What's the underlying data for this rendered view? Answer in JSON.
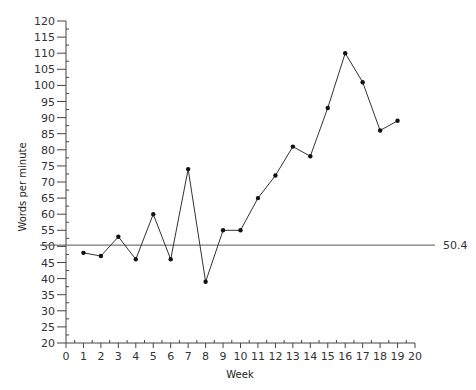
{
  "chart_data": {
    "type": "line",
    "title": "",
    "xlabel": "Week",
    "ylabel": "Words per minute",
    "xlim": [
      0,
      20
    ],
    "ylim": [
      20,
      120
    ],
    "x_ticks": [
      0,
      1,
      2,
      3,
      4,
      5,
      6,
      7,
      8,
      9,
      10,
      11,
      12,
      13,
      14,
      15,
      16,
      17,
      18,
      19,
      20
    ],
    "y_ticks": [
      20,
      25,
      30,
      35,
      40,
      45,
      50,
      55,
      60,
      65,
      70,
      75,
      80,
      85,
      90,
      95,
      100,
      105,
      110,
      115,
      120
    ],
    "grid": false,
    "legend": null,
    "x": [
      1,
      2,
      3,
      4,
      5,
      6,
      7,
      8,
      9,
      10,
      11,
      12,
      13,
      14,
      15,
      16,
      17,
      18,
      19
    ],
    "series": [
      {
        "name": "Words per minute",
        "values": [
          48,
          47,
          53,
          46,
          60,
          46,
          74,
          39,
          55,
          55,
          65,
          72,
          81,
          78,
          93,
          110,
          101,
          86,
          89
        ]
      }
    ],
    "reference_line": {
      "value": 50.4,
      "label": "50.4"
    },
    "colors": {
      "line": "#333333",
      "marker": "#111111",
      "axis": "#444444"
    }
  }
}
